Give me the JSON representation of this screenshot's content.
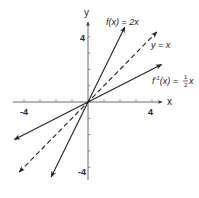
{
  "chart_data": {
    "type": "line",
    "title": "",
    "xlabel": "x",
    "ylabel": "y",
    "xlim": [
      -4.7,
      4.7
    ],
    "ylim": [
      -4.7,
      4.7
    ],
    "x_ticks": [
      -4,
      -3,
      -2,
      -1,
      1,
      2,
      3,
      4
    ],
    "y_ticks": [
      -4,
      -3,
      -2,
      -1,
      1,
      2,
      3,
      4
    ],
    "x_tick_labels": [
      {
        "value": -4,
        "text": "-4"
      },
      {
        "value": 4,
        "text": "4"
      }
    ],
    "y_tick_labels": [
      {
        "value": 4,
        "text": "4"
      },
      {
        "value": -4,
        "text": "-4"
      }
    ],
    "grid": false,
    "series": [
      {
        "name": "f(x) = 2x",
        "slope": 2,
        "style": "solid",
        "x": [
          -2.3,
          2.3
        ],
        "y": [
          -4.6,
          4.6
        ],
        "label": "f(x) = 2x"
      },
      {
        "name": "y = x",
        "slope": 1,
        "style": "dashed",
        "x": [
          -4.3,
          4.3
        ],
        "y": [
          -4.3,
          4.3
        ],
        "label": "y = x"
      },
      {
        "name": "f⁻¹(x) = ½x",
        "slope": 0.5,
        "style": "solid",
        "x": [
          -4.6,
          4.6
        ],
        "y": [
          -2.3,
          2.3
        ],
        "label_prefix": "f",
        "label_sup": "-1",
        "label_mid": "(x) = ",
        "label_frac_num": "1",
        "label_frac_den": "2",
        "label_suffix": "x"
      }
    ]
  }
}
